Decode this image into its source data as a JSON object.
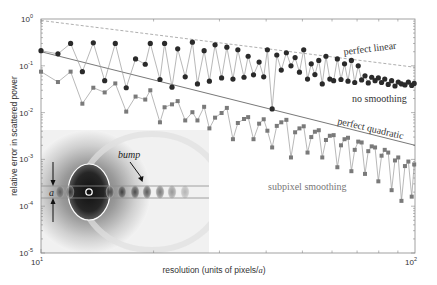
{
  "chart_data": {
    "type": "line",
    "title": "",
    "xlabel": "resolution (units of pixels/a)",
    "xlabel_parts": {
      "before": "resolution (units of pixels/",
      "italic": "a",
      "after": ")"
    },
    "ylabel": "relative error in scattered power",
    "xscale": "log",
    "yscale": "log",
    "xlim": [
      10,
      100
    ],
    "ylim": [
      1e-05,
      1
    ],
    "x_ticks": [
      {
        "value": 10,
        "base": "10",
        "exp": "1"
      },
      {
        "value": 100,
        "base": "10",
        "exp": "2"
      }
    ],
    "y_ticks": [
      {
        "value": 1,
        "base": "10",
        "exp": "0"
      },
      {
        "value": 0.1,
        "base": "10",
        "exp": "-1"
      },
      {
        "value": 0.01,
        "base": "10",
        "exp": "-2"
      },
      {
        "value": 0.001,
        "base": "10",
        "exp": "-3"
      },
      {
        "value": 0.0001,
        "base": "10",
        "exp": "-4"
      },
      {
        "value": 1e-05,
        "base": "10",
        "exp": "-5"
      }
    ],
    "grid": false,
    "reference_lines": [
      {
        "name": "perfect linear",
        "style": "dashed",
        "x": [
          10,
          100
        ],
        "y": [
          0.93,
          0.093
        ]
      },
      {
        "name": "perfect quadratic",
        "style": "solid",
        "x": [
          10,
          100
        ],
        "y": [
          0.2,
          0.002
        ]
      }
    ],
    "series": [
      {
        "name": "no smoothing",
        "marker": "circle",
        "color": "#2a2a2a",
        "x": [
          10.0,
          11.1,
          12.0,
          12.9,
          13.8,
          14.8,
          15.8,
          16.9,
          17.9,
          19.0,
          19.6,
          20.8,
          21.4,
          22.4,
          23.2,
          24.3,
          25.4,
          26.2,
          27.3,
          28.2,
          29.2,
          30.4,
          31.4,
          32.6,
          33.6,
          34.9,
          35.8,
          37.0,
          38.3,
          39.4,
          40.3,
          41.5,
          42.7,
          43.9,
          45.3,
          46.6,
          47.8,
          49.1,
          50.4,
          51.6,
          52.8,
          54.0,
          55.3,
          56.5,
          57.8,
          59.2,
          60.6,
          62.0,
          63.4,
          64.8,
          66.2,
          67.6,
          69.0,
          70.5,
          72.0,
          73.5,
          75.0,
          76.6,
          78.2,
          79.8,
          81.4,
          83.0,
          84.8,
          86.6,
          88.4,
          90.2,
          92.0,
          94.0,
          96.0,
          98.0,
          99.5
        ],
        "y": [
          0.21,
          0.18,
          0.3,
          0.075,
          0.31,
          0.048,
          0.3,
          0.034,
          0.14,
          0.108,
          0.3,
          0.051,
          0.3,
          0.035,
          0.23,
          0.058,
          0.32,
          0.041,
          0.21,
          0.047,
          0.28,
          0.055,
          0.25,
          0.052,
          0.22,
          0.057,
          0.16,
          0.064,
          0.12,
          0.058,
          0.22,
          0.012,
          0.17,
          0.081,
          0.19,
          0.1,
          0.15,
          0.073,
          0.22,
          0.052,
          0.11,
          0.065,
          0.13,
          0.041,
          0.16,
          0.052,
          0.048,
          0.14,
          0.051,
          0.11,
          0.047,
          0.13,
          0.044,
          0.1,
          0.05,
          0.061,
          0.043,
          0.057,
          0.048,
          0.055,
          0.044,
          0.052,
          0.04,
          0.048,
          0.037,
          0.045,
          0.041,
          0.039,
          0.045,
          0.038,
          0.042
        ]
      },
      {
        "name": "subpixel smoothing",
        "marker": "square",
        "color": "#7a7a7a",
        "x": [
          10.0,
          11.1,
          12.0,
          12.9,
          13.8,
          14.8,
          15.8,
          16.9,
          17.9,
          19.0,
          19.6,
          20.8,
          21.4,
          22.4,
          23.2,
          24.3,
          25.4,
          26.2,
          27.3,
          28.2,
          29.2,
          30.4,
          31.4,
          32.6,
          33.6,
          34.9,
          35.8,
          37.0,
          38.3,
          39.4,
          40.3,
          41.5,
          42.7,
          43.9,
          45.3,
          46.6,
          47.8,
          49.1,
          50.4,
          51.6,
          52.8,
          54.0,
          55.3,
          56.5,
          57.8,
          59.2,
          60.6,
          62.0,
          63.4,
          64.8,
          66.2,
          67.6,
          69.0,
          70.5,
          72.0,
          73.5,
          75.0,
          76.6,
          78.2,
          79.8,
          81.4,
          83.0,
          84.8,
          86.6,
          88.4,
          90.2,
          92.0,
          94.0,
          96.0,
          98.0,
          99.5
        ],
        "y": [
          0.075,
          0.045,
          0.075,
          0.0155,
          0.034,
          0.027,
          0.042,
          0.0105,
          0.022,
          0.019,
          0.03,
          0.0062,
          0.013,
          0.015,
          0.0176,
          0.0068,
          0.0102,
          0.0068,
          0.0133,
          0.0046,
          0.0078,
          0.0098,
          0.0126,
          0.0027,
          0.006,
          0.0073,
          0.008,
          0.0027,
          0.0058,
          0.0072,
          0.0041,
          0.0018,
          0.0052,
          0.0062,
          0.007,
          0.0011,
          0.0038,
          0.0046,
          0.0051,
          0.0014,
          0.003,
          0.0039,
          0.0042,
          0.0011,
          0.0026,
          0.0032,
          0.0033,
          0.00068,
          0.002,
          0.0027,
          0.0029,
          0.00056,
          0.0016,
          0.0024,
          0.0023,
          0.00049,
          0.0015,
          0.0019,
          0.0018,
          0.00034,
          0.0012,
          0.0016,
          0.0014,
          0.00022,
          0.00095,
          0.0011,
          0.00013,
          0.00072,
          0.0009,
          0.00016,
          0.00078
        ]
      }
    ],
    "annotations": [
      {
        "text": "perfect linear",
        "near": "upper-right, above dashed line"
      },
      {
        "text": "no smoothing",
        "near": "right, below circle series"
      },
      {
        "text": "perfect quadratic",
        "near": "right, above solid line"
      },
      {
        "text": "subpixel smoothing",
        "near": "center-right, below square series"
      }
    ],
    "inset": {
      "description": "grayscale field pattern of waveguide with bump",
      "labels": {
        "bump": "bump",
        "width": "a"
      }
    }
  }
}
